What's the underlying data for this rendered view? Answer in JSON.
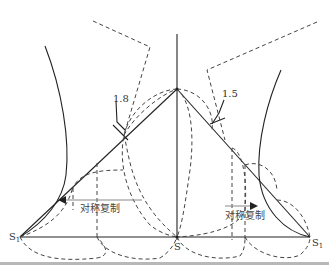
{
  "diagram": {
    "type": "geometric-construction",
    "labels": {
      "left_dim": "1.8",
      "right_dim": "1.5",
      "left_copy": "对称复制",
      "right_copy": "对称复制",
      "left_point": "S",
      "left_point_sub": "1",
      "center_point": "S",
      "right_point": "S",
      "right_point_sub": "1"
    },
    "colors": {
      "line": "#222222",
      "dashed": "#444444",
      "arrow": "#888888",
      "rule": "#b8b8b8"
    }
  }
}
